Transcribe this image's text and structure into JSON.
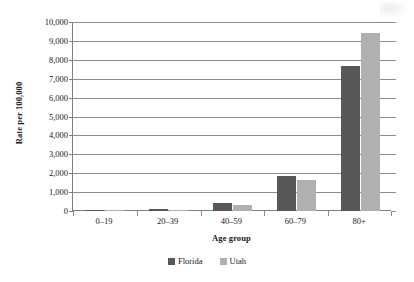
{
  "chart_data": {
    "type": "bar",
    "title": "",
    "subtitle": "",
    "xlabel": "Age group",
    "ylabel": "Rate per 100,000",
    "categories": [
      "0–19",
      "20–39",
      "40–59",
      "60–79",
      "80+"
    ],
    "series": [
      {
        "name": "Florida",
        "color": "#575757",
        "values": [
          40,
          95,
          450,
          1840,
          7650
        ]
      },
      {
        "name": "Utah",
        "color": "#b0b0b0",
        "values": [
          20,
          55,
          330,
          1620,
          9400
        ]
      }
    ],
    "ylim": [
      0,
      10000
    ],
    "ytick_step": 1000,
    "ytick_labels": [
      "0",
      "1,000",
      "2,000",
      "3,000",
      "4,000",
      "5,000",
      "6,000",
      "7,000",
      "8,000",
      "9,000",
      "10,000"
    ],
    "grid": "horizontal",
    "legend_position": "bottom-center"
  },
  "axes": {
    "y_title": "Rate per 100,000",
    "x_title": "Age group"
  }
}
